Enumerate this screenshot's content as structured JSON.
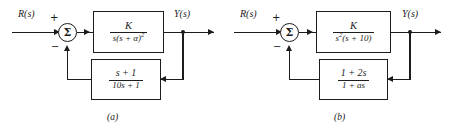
{
  "figure": {
    "background_color": "#ffffff",
    "line_color": "#1c1c1c",
    "panels": [
      {
        "caption": "(a)",
        "input_label": "R(s)",
        "output_label": "Y(s)",
        "summing_junction": {
          "glyph": "Σ",
          "input_sign": "+",
          "feedback_sign": "−"
        },
        "forward_block": {
          "numerator": "K",
          "denominator_pre": "s(s + α)",
          "denominator_exponent": "2",
          "transfer_function": "K / (s(s + α)^2)"
        },
        "feedback_block": {
          "numerator": "s + 1",
          "denominator": "10s + 1",
          "transfer_function": "(s + 1) / (10s + 1)"
        }
      },
      {
        "caption": "(b)",
        "input_label": "R(s)",
        "output_label": "Y(s)",
        "summing_junction": {
          "glyph": "Σ",
          "input_sign": "+",
          "feedback_sign": "−"
        },
        "forward_block": {
          "numerator": "K",
          "denominator_pre": "s",
          "denominator_exponent": "2",
          "denominator_post": "(s + 10)",
          "transfer_function": "K / (s^2(s + 10))"
        },
        "feedback_block": {
          "numerator": "1 + 2s",
          "denominator": "1 + as",
          "transfer_function": "(1 + 2s) / (1 + as)"
        }
      }
    ]
  }
}
